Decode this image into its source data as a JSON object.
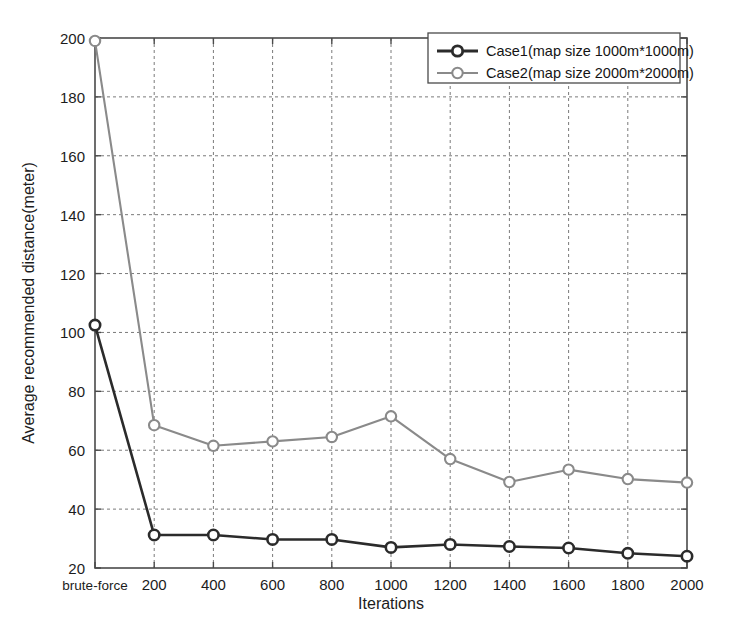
{
  "figure": {
    "background_color": "#ffffff",
    "axes_color": "#4a4a4a",
    "grid_color": "#7a7a7a"
  },
  "chart_data": {
    "type": "line",
    "title": "",
    "xlabel": "Iterations",
    "ylabel": "Average recommended distance(meter)",
    "categories": [
      "brute-force",
      "200",
      "400",
      "600",
      "800",
      "1000",
      "1200",
      "1400",
      "1600",
      "1800",
      "2000"
    ],
    "xtick_labels": [
      "brute-force",
      "200",
      "400",
      "600",
      "800",
      "1000",
      "1200",
      "1400",
      "1600",
      "1800",
      "2000"
    ],
    "ytick_labels": [
      "20",
      "40",
      "60",
      "80",
      "100",
      "120",
      "140",
      "160",
      "180",
      "200"
    ],
    "ytick_values": [
      20,
      40,
      60,
      80,
      100,
      120,
      140,
      160,
      180,
      200
    ],
    "ylim": [
      20,
      200
    ],
    "grid": true,
    "grid_style": "dashed",
    "legend_position": "top-right",
    "markers": "circle",
    "series": [
      {
        "name": "Case1(map size 1000m*1000m)",
        "color": "#2b2b2b",
        "line_width": 2.6,
        "values": [
          102.5,
          31.2,
          31.2,
          29.7,
          29.7,
          27.0,
          28.0,
          27.3,
          26.8,
          25.0,
          24.0
        ]
      },
      {
        "name": "Case2(map size 2000m*2000m)",
        "color": "#8a8a8a",
        "line_width": 2.1,
        "values": [
          199.0,
          68.5,
          61.5,
          63.0,
          64.5,
          71.5,
          57.0,
          49.2,
          53.4,
          50.2,
          49.0
        ]
      }
    ]
  },
  "legend": {
    "entries": [
      {
        "label": "Case1(map size 1000m*1000m)",
        "color": "#2b2b2b"
      },
      {
        "label": "Case2(map size 2000m*2000m)",
        "color": "#8a8a8a"
      }
    ]
  }
}
